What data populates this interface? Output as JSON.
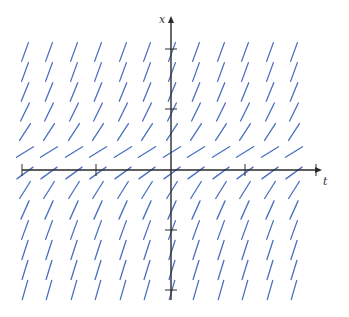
{
  "diagram": {
    "type": "slope-field",
    "axes": {
      "horizontal_label": "t",
      "vertical_label": "x",
      "color": "#2a2a2a",
      "origin_px": [
        171,
        170
      ],
      "h_extent_px": [
        22,
        322
      ],
      "v_extent_px": [
        16,
        300
      ],
      "h_ticks_px": [
        22,
        96,
        245,
        316
      ],
      "v_ticks_px": [
        49,
        109,
        230,
        290
      ]
    },
    "segments": {
      "color": "#4a6fc0",
      "length_px": 20,
      "columns_px": [
        25,
        49,
        74,
        98,
        123,
        147,
        172,
        196,
        221,
        245,
        270,
        294
      ],
      "rows": [
        {
          "y": 52,
          "angle_deg": 70
        },
        {
          "y": 72,
          "angle_deg": 70
        },
        {
          "y": 92,
          "angle_deg": 68
        },
        {
          "y": 112,
          "angle_deg": 64
        },
        {
          "y": 132,
          "angle_deg": 57
        },
        {
          "y": 152,
          "angle_deg": 32
        },
        {
          "y": 173,
          "angle_deg": 36
        },
        {
          "y": 190,
          "angle_deg": 58
        },
        {
          "y": 210,
          "angle_deg": 66
        },
        {
          "y": 230,
          "angle_deg": 70
        },
        {
          "y": 250,
          "angle_deg": 72
        },
        {
          "y": 270,
          "angle_deg": 73
        },
        {
          "y": 290,
          "angle_deg": 74
        }
      ]
    }
  }
}
